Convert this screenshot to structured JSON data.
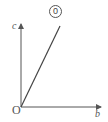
{
  "diagram": {
    "origin_label": "O",
    "vertical_axis_label": "c",
    "horizontal_axis_label": "b",
    "ray_label": "0",
    "colors": {
      "line": "#555555",
      "background": "#ffffff"
    }
  }
}
